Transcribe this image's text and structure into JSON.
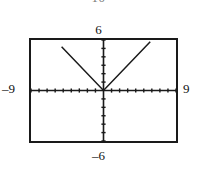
{
  "figure": {
    "kind": "graphing-calculator-viewing-window",
    "top_clipped_label": "10"
  },
  "window_labels": {
    "ymax": "6",
    "ymin": "–6",
    "xmin": "–9",
    "xmax": "9"
  },
  "colors": {
    "border": "#1a1a1a",
    "axis": "#1a1a1a",
    "curve": "#1a1a1a",
    "background": "#ffffff",
    "clipped_text": "#7a7a7a"
  },
  "chart_data": {
    "type": "line",
    "title": "",
    "xlabel": "",
    "ylabel": "",
    "xlim": [
      -9,
      9
    ],
    "ylim": [
      -6,
      6
    ],
    "grid": false,
    "legend": "none",
    "x_tick_labels": [
      "–9",
      "9"
    ],
    "y_tick_labels": [
      "6",
      "–6"
    ],
    "x_tick_step": 1,
    "y_tick_step": 1,
    "axis_ticks_visible": true,
    "series": [
      {
        "name": "y = |x|",
        "comment": "V-shaped absolute-value graph, vertex at origin, slope magnitude 1, drawn to top of window",
        "x": [
          -5.2,
          0,
          5.8
        ],
        "y": [
          5.2,
          0,
          5.8
        ]
      }
    ],
    "annotations": [
      {
        "text": "6",
        "position": "above-window",
        "role": "Ymax"
      },
      {
        "text": "–6",
        "position": "below-window",
        "role": "Ymin"
      },
      {
        "text": "–9",
        "position": "left-of-window",
        "role": "Xmin"
      },
      {
        "text": "9",
        "position": "right-of-window",
        "role": "Xmax"
      },
      {
        "text": "10",
        "position": "top-edge-clipped",
        "role": "clipped"
      }
    ]
  }
}
